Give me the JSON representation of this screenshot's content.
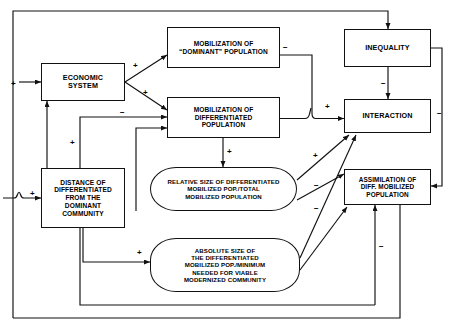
{
  "diagram": {
    "type": "flowchart",
    "canvas": {
      "width": 454,
      "height": 331,
      "background": "#ffffff",
      "line_color": "#111111"
    },
    "nodes": [
      {
        "id": "economic-system",
        "label": "ECONOMIC\nSYSTEM",
        "shape": "rectangle",
        "x": 41,
        "y": 63,
        "w": 84,
        "h": 38,
        "font_size": 7.2
      },
      {
        "id": "mobilization-dominant",
        "label": "MOBILIZATION OF\n“DOMINANT” POPULATION",
        "shape": "rectangle",
        "x": 167,
        "y": 27,
        "w": 113,
        "h": 41,
        "font_size": 6.6
      },
      {
        "id": "mobilization-differentiated",
        "label": "MOBILIZATION OF\nDIFFERENTIATED\nPOPULATION",
        "shape": "rectangle",
        "x": 167,
        "y": 97,
        "w": 113,
        "h": 41,
        "font_size": 6.6
      },
      {
        "id": "inequality",
        "label": "INEQUALITY",
        "shape": "rectangle",
        "x": 344,
        "y": 29,
        "w": 87,
        "h": 38,
        "font_size": 7.2
      },
      {
        "id": "interaction",
        "label": "INTERACTION",
        "shape": "rectangle",
        "x": 344,
        "y": 99,
        "w": 87,
        "h": 34,
        "font_size": 7.2
      },
      {
        "id": "distance-differentiated",
        "label": "DISTANCE OF\nDIFFERENTIATED\nFROM THE\nDOMINANT\nCOMMUNITY",
        "shape": "rectangle",
        "x": 41,
        "y": 168,
        "w": 84,
        "h": 60,
        "font_size": 6.6
      },
      {
        "id": "relative-size",
        "label": "RELATIVE SIZE OF DIFFERENTIATED\nMOBILIZED POP./TOTAL\nMOBILIZED POPULATION",
        "shape": "rounded",
        "x": 150,
        "y": 167,
        "w": 147,
        "h": 44,
        "font_size": 6.1
      },
      {
        "id": "assimilation",
        "label": "ASSIMILATION OF\nDIFF. MOBILIZED\nPOPULATION",
        "shape": "rectangle",
        "x": 344,
        "y": 169,
        "w": 87,
        "h": 36,
        "font_size": 6.4
      },
      {
        "id": "absolute-size",
        "label": "ABSOLUTE SIZE OF\nTHE DIFFERENTIATED\nMOBILIZED POP./MINIMUM\nNEEDED FOR VIABLE\nMODERNIZED COMMUNITY",
        "shape": "rounded",
        "x": 150,
        "y": 238,
        "w": 150,
        "h": 54,
        "font_size": 6.1
      }
    ],
    "signs": [
      {
        "id": "sign-into-economic-left",
        "text": "+",
        "x": 11,
        "y": 80
      },
      {
        "id": "sign-economic-to-dominant",
        "text": "+",
        "x": 133,
        "y": 62
      },
      {
        "id": "sign-economic-to-differentiated",
        "text": "+",
        "x": 143,
        "y": 89
      },
      {
        "id": "sign-dominant-to-interaction",
        "text": "−",
        "x": 283,
        "y": 44
      },
      {
        "id": "sign-into-interaction-left",
        "text": "+",
        "x": 325,
        "y": 103
      },
      {
        "id": "sign-inequality-to-interaction",
        "text": "−",
        "x": 381,
        "y": 80
      },
      {
        "id": "sign-interaction-right",
        "text": "−",
        "x": 437,
        "y": 110
      },
      {
        "id": "sign-distance-to-differentiated",
        "text": "−",
        "x": 120,
        "y": 109
      },
      {
        "id": "sign-distance-up-economic",
        "text": "+",
        "x": 70,
        "y": 139
      },
      {
        "id": "sign-into-distance-left",
        "text": "+",
        "x": 30,
        "y": 190
      },
      {
        "id": "sign-differentiated-to-relative",
        "text": "+",
        "x": 227,
        "y": 148
      },
      {
        "id": "sign-relative-to-interaction",
        "text": "+",
        "x": 313,
        "y": 152
      },
      {
        "id": "sign-to-absolute",
        "text": "+",
        "x": 137,
        "y": 249
      },
      {
        "id": "sign-relative-to-assimilation",
        "text": "−",
        "x": 314,
        "y": 182
      },
      {
        "id": "sign-absolute-to-assimilation",
        "text": "−",
        "x": 314,
        "y": 205
      },
      {
        "id": "sign-assimilation-down",
        "text": "−",
        "x": 379,
        "y": 243
      }
    ],
    "edges": [
      {
        "id": "edge-economic-to-dominant",
        "from": "economic-system",
        "to": "mobilization-dominant",
        "sign": "+"
      },
      {
        "id": "edge-economic-to-differentiated",
        "from": "economic-system",
        "to": "mobilization-differentiated",
        "sign": "+"
      },
      {
        "id": "edge-dominant-to-interaction",
        "from": "mobilization-dominant",
        "to": "interaction",
        "sign": "−"
      },
      {
        "id": "edge-differentiated-to-interaction",
        "from": "mobilization-differentiated",
        "to": "interaction",
        "sign": "+"
      },
      {
        "id": "edge-inequality-to-interaction",
        "from": "inequality",
        "to": "interaction",
        "sign": "−"
      },
      {
        "id": "edge-interaction-to-assimilation",
        "from": "interaction",
        "to": "assimilation",
        "sign": "−"
      },
      {
        "id": "edge-differentiated-to-relative",
        "from": "mobilization-differentiated",
        "to": "relative-size",
        "sign": "+"
      },
      {
        "id": "edge-relative-to-interaction",
        "from": "relative-size",
        "to": "interaction",
        "sign": "+"
      },
      {
        "id": "edge-relative-to-assimilation",
        "from": "relative-size",
        "to": "assimilation",
        "sign": "−"
      },
      {
        "id": "edge-absolute-to-assimilation",
        "from": "absolute-size",
        "to": "assimilation",
        "sign": "−"
      },
      {
        "id": "edge-absolute-to-interaction",
        "from": "absolute-size",
        "to": "interaction",
        "sign": "+"
      },
      {
        "id": "edge-distance-to-differentiated",
        "from": "distance-differentiated",
        "to": "mobilization-differentiated",
        "sign": "−"
      },
      {
        "id": "edge-distance-to-economic",
        "from": "distance-differentiated",
        "to": "economic-system",
        "sign": "+"
      },
      {
        "id": "edge-distance-to-absolute",
        "from": "distance-differentiated",
        "to": "absolute-size",
        "sign": "+"
      },
      {
        "id": "edge-assimilation-to-distance",
        "from": "assimilation",
        "to": "distance-differentiated",
        "sign": "−"
      },
      {
        "id": "edge-assimilation-to-economic",
        "from": "assimilation",
        "to": "economic-system",
        "sign": "+"
      },
      {
        "id": "edge-interaction-loop-top",
        "from": "interaction",
        "to": "inequality",
        "sign": ""
      }
    ]
  }
}
